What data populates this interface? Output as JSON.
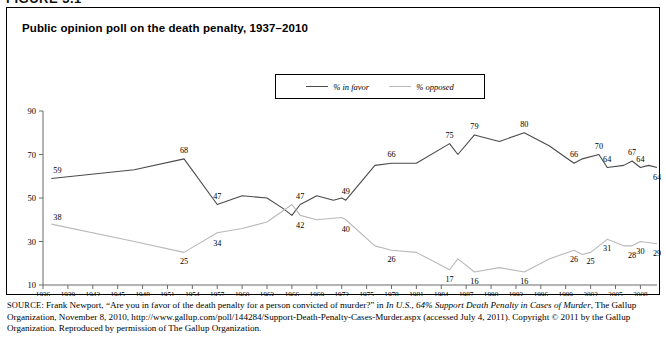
{
  "figure_label": "FIGURE 3.1",
  "chart": {
    "title": "Public opinion poll on the death penalty, 1937–2010",
    "legend": [
      {
        "label": "% in favor",
        "color": "#4a4a4a",
        "name": "legend-item-in-favor"
      },
      {
        "label": "% opposed",
        "color": "#b9b9b9",
        "name": "legend-item-opposed"
      }
    ]
  },
  "source": {
    "prefix": "SOURCE",
    "text_1": ": Frank Newport, “Are you in favor of the death penalty for a person convicted of murder?” in ",
    "italic_1": "In U.S., 64% Support Death Penalty in Cases of Murder",
    "text_2": ", The Gallup Organization, November 8, 2010, http://www.gallup.com/poll/144284/Support-Death-Penalty-Cases-Murder.aspx (accessed July 4, 2011). Copyright © 2011 by the Gallup Organization. Reproduced by permission of The Gallup Organization."
  },
  "chart_data": {
    "type": "line",
    "title": "Public opinion poll on the death penalty, 1937–2010",
    "xlabel": "",
    "ylabel": "",
    "xlim": [
      1936,
      2010
    ],
    "ylim": [
      10,
      90
    ],
    "yticks": [
      10,
      30,
      50,
      70,
      90
    ],
    "xticks": [
      1936,
      1939,
      1942,
      1945,
      1948,
      1951,
      1954,
      1957,
      1960,
      1963,
      1966,
      1969,
      1972,
      1975,
      1978,
      1981,
      1984,
      1987,
      1990,
      1993,
      1996,
      1999,
      2002,
      2005,
      2008
    ],
    "grid": false,
    "legend_position": "top-center",
    "series": [
      {
        "name": "% in favor",
        "color": "#4a4a4a",
        "points": [
          {
            "x": 1937,
            "y": 59,
            "label": "59"
          },
          {
            "x": 1947,
            "y": 63,
            "label": ""
          },
          {
            "x": 1953,
            "y": 68,
            "label": "68"
          },
          {
            "x": 1957,
            "y": 47,
            "label": "47"
          },
          {
            "x": 1960,
            "y": 51,
            "label": ""
          },
          {
            "x": 1963,
            "y": 50,
            "label": ""
          },
          {
            "x": 1965,
            "y": 45,
            "label": ""
          },
          {
            "x": 1966,
            "y": 42,
            "label": ""
          },
          {
            "x": 1967,
            "y": 47,
            "label": "47"
          },
          {
            "x": 1969,
            "y": 51,
            "label": ""
          },
          {
            "x": 1971,
            "y": 49,
            "label": ""
          },
          {
            "x": 1972,
            "y": 50,
            "label": ""
          },
          {
            "x": 1972.5,
            "y": 49,
            "label": "49"
          },
          {
            "x": 1976,
            "y": 65,
            "label": ""
          },
          {
            "x": 1978,
            "y": 66,
            "label": "66"
          },
          {
            "x": 1981,
            "y": 66,
            "label": ""
          },
          {
            "x": 1985,
            "y": 75,
            "label": "75"
          },
          {
            "x": 1986,
            "y": 70,
            "label": ""
          },
          {
            "x": 1988,
            "y": 79,
            "label": "79"
          },
          {
            "x": 1991,
            "y": 76,
            "label": ""
          },
          {
            "x": 1994,
            "y": 80,
            "label": "80"
          },
          {
            "x": 1997,
            "y": 74,
            "label": ""
          },
          {
            "x": 2000,
            "y": 66,
            "label": "66"
          },
          {
            "x": 2001,
            "y": 68,
            "label": ""
          },
          {
            "x": 2003,
            "y": 70,
            "label": "70"
          },
          {
            "x": 2004,
            "y": 64,
            "label": "64"
          },
          {
            "x": 2006,
            "y": 65,
            "label": ""
          },
          {
            "x": 2007,
            "y": 67,
            "label": "67"
          },
          {
            "x": 2008,
            "y": 64,
            "label": "64"
          },
          {
            "x": 2009,
            "y": 65,
            "label": ""
          },
          {
            "x": 2010,
            "y": 64,
            "label": "64"
          }
        ]
      },
      {
        "name": "% opposed",
        "color": "#b9b9b9",
        "points": [
          {
            "x": 1937,
            "y": 38,
            "label": "38"
          },
          {
            "x": 1947,
            "y": 30,
            "label": ""
          },
          {
            "x": 1953,
            "y": 25,
            "label": "25"
          },
          {
            "x": 1957,
            "y": 34,
            "label": "34"
          },
          {
            "x": 1960,
            "y": 36,
            "label": ""
          },
          {
            "x": 1963,
            "y": 39,
            "label": ""
          },
          {
            "x": 1966,
            "y": 47,
            "label": ""
          },
          {
            "x": 1967,
            "y": 42,
            "label": "42"
          },
          {
            "x": 1969,
            "y": 40,
            "label": ""
          },
          {
            "x": 1972,
            "y": 41,
            "label": ""
          },
          {
            "x": 1972.5,
            "y": 40,
            "label": "40"
          },
          {
            "x": 1976,
            "y": 28,
            "label": ""
          },
          {
            "x": 1978,
            "y": 26,
            "label": "26"
          },
          {
            "x": 1981,
            "y": 25,
            "label": ""
          },
          {
            "x": 1985,
            "y": 17,
            "label": "17"
          },
          {
            "x": 1986,
            "y": 22,
            "label": ""
          },
          {
            "x": 1988,
            "y": 16,
            "label": "16"
          },
          {
            "x": 1991,
            "y": 18,
            "label": ""
          },
          {
            "x": 1994,
            "y": 16,
            "label": "16"
          },
          {
            "x": 1997,
            "y": 22,
            "label": ""
          },
          {
            "x": 2000,
            "y": 26,
            "label": "26"
          },
          {
            "x": 2001,
            "y": 24,
            "label": ""
          },
          {
            "x": 2002,
            "y": 25,
            "label": "25"
          },
          {
            "x": 2004,
            "y": 31,
            "label": "31"
          },
          {
            "x": 2006,
            "y": 28,
            "label": ""
          },
          {
            "x": 2007,
            "y": 28,
            "label": "28"
          },
          {
            "x": 2008,
            "y": 30,
            "label": "30"
          },
          {
            "x": 2010,
            "y": 29,
            "label": "29"
          }
        ]
      }
    ]
  }
}
